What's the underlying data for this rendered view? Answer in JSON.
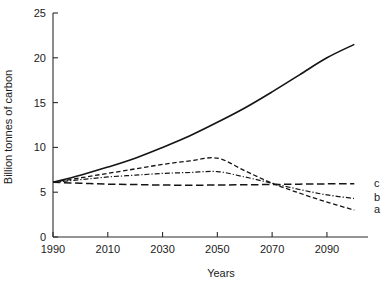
{
  "chart_data": {
    "type": "line",
    "title": "",
    "xlabel": "Years",
    "ylabel": "Billion tonnes of carbon",
    "xlim": [
      1990,
      2105
    ],
    "ylim": [
      0,
      25
    ],
    "xticks": [
      1990,
      2010,
      2030,
      2050,
      2070,
      2090
    ],
    "xtick_labels": [
      "1990",
      "2010",
      "2030",
      "2050",
      "2070",
      "2090"
    ],
    "yticks": [
      0,
      5,
      10,
      15,
      20,
      25
    ],
    "ytick_labels": [
      "0",
      "5",
      "10",
      "15",
      "20",
      "25"
    ],
    "grid": false,
    "legend_position": "right-inline",
    "x": [
      1990,
      2000,
      2010,
      2020,
      2030,
      2040,
      2050,
      2060,
      2070,
      2080,
      2090,
      2100
    ],
    "series": [
      {
        "name": "reference",
        "label": "",
        "dash": "solid",
        "color": "#141414",
        "values": [
          6.1,
          6.9,
          7.8,
          8.8,
          10.0,
          11.3,
          12.8,
          14.4,
          16.2,
          18.1,
          20.0,
          21.5
        ]
      },
      {
        "name": "a",
        "label": "a",
        "dash": "short-dash",
        "color": "#141414",
        "values": [
          6.1,
          6.6,
          7.1,
          7.6,
          8.1,
          8.5,
          8.8,
          7.4,
          6.0,
          4.9,
          3.9,
          3.0
        ]
      },
      {
        "name": "b",
        "label": "b",
        "dash": "dash-dot",
        "color": "#141414",
        "values": [
          6.1,
          6.4,
          6.7,
          6.9,
          7.1,
          7.2,
          7.3,
          6.7,
          6.0,
          5.3,
          4.7,
          4.3
        ]
      },
      {
        "name": "c",
        "label": "c",
        "dash": "long-dash",
        "color": "#141414",
        "values": [
          6.1,
          6.0,
          5.9,
          5.85,
          5.8,
          5.78,
          5.8,
          5.83,
          5.86,
          5.9,
          5.93,
          5.95
        ]
      }
    ]
  },
  "labels": {
    "series_a": "a",
    "series_b": "b",
    "series_c": "c",
    "x_axis_title": "Years",
    "y_axis_title": "Billion tonnes of carbon"
  }
}
